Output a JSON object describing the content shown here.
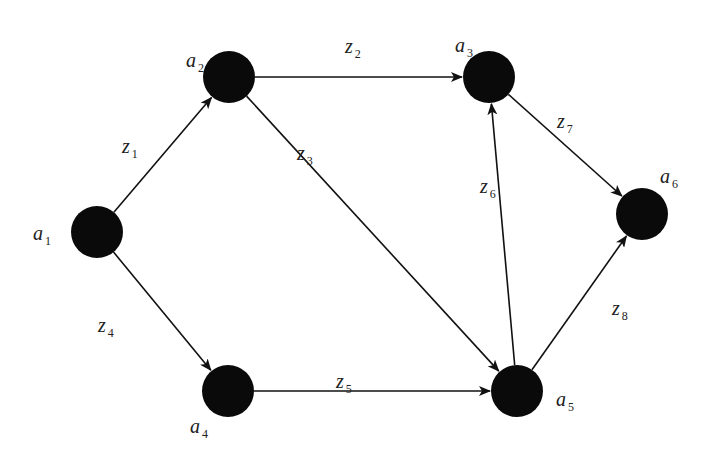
{
  "diagram": {
    "type": "directed-graph",
    "nodes": [
      {
        "id": "a1",
        "base": "a",
        "sub": "1"
      },
      {
        "id": "a2",
        "base": "a",
        "sub": "2"
      },
      {
        "id": "a3",
        "base": "a",
        "sub": "3"
      },
      {
        "id": "a4",
        "base": "a",
        "sub": "4"
      },
      {
        "id": "a5",
        "base": "a",
        "sub": "5"
      },
      {
        "id": "a6",
        "base": "a",
        "sub": "6"
      }
    ],
    "edges": [
      {
        "id": "z1",
        "base": "z",
        "sub": "1",
        "from": "a1",
        "to": "a2"
      },
      {
        "id": "z2",
        "base": "z",
        "sub": "2",
        "from": "a2",
        "to": "a3"
      },
      {
        "id": "z3",
        "base": "z",
        "sub": "3",
        "from": "a2",
        "to": "a5"
      },
      {
        "id": "z4",
        "base": "z",
        "sub": "4",
        "from": "a1",
        "to": "a4"
      },
      {
        "id": "z5",
        "base": "z",
        "sub": "5",
        "from": "a4",
        "to": "a5"
      },
      {
        "id": "z6",
        "base": "z",
        "sub": "6",
        "from": "a5",
        "to": "a3"
      },
      {
        "id": "z7",
        "base": "z",
        "sub": "7",
        "from": "a3",
        "to": "a6"
      },
      {
        "id": "z8",
        "base": "z",
        "sub": "8",
        "from": "a5",
        "to": "a6"
      }
    ],
    "colors": {
      "node": "#0a0a0a",
      "edge": "#111111",
      "text": "#222222"
    }
  }
}
